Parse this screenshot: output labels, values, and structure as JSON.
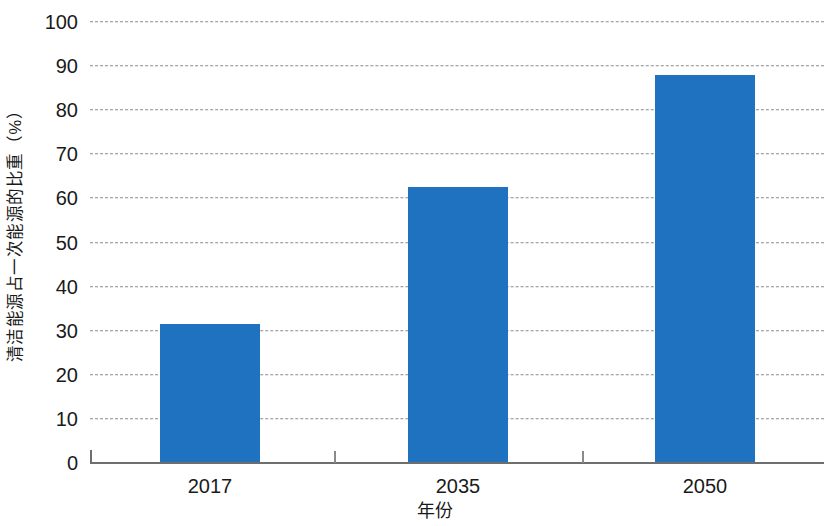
{
  "chart_data": {
    "type": "bar",
    "title": "",
    "subtitle": "",
    "categories": [
      "2017",
      "2035",
      "2050"
    ],
    "values": [
      31.5,
      62.5,
      88
    ],
    "xlabel": "年份",
    "ylabel": "清洁能源占一次能源的比重（%）",
    "ylim": [
      0,
      100
    ],
    "ytick_labels": [
      "100",
      "90",
      "80",
      "70",
      "60",
      "50",
      "40",
      "30",
      "20",
      "10",
      "0"
    ],
    "ytick_values": [
      100,
      90,
      80,
      70,
      60,
      50,
      40,
      30,
      20,
      10,
      0
    ],
    "grid": true,
    "grid_style": "dashed",
    "legend": null,
    "legend_position": "none",
    "series": [
      {
        "name": "清洁能源占一次能源的比重",
        "values": [
          31.5,
          62.5,
          88
        ],
        "color": "#1f72bf"
      }
    ],
    "annotations": []
  },
  "style": {
    "bar_color": "#1f72bf",
    "grid_color": "#8a8a8a",
    "axis_color": "#6e6e6e",
    "text_color": "#1a1a1a",
    "background": "#ffffff"
  }
}
